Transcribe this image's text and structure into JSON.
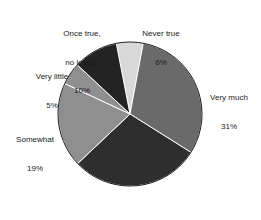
{
  "chart_data": {
    "type": "pie",
    "title": "",
    "subtitle": "",
    "xlabel": "",
    "ylabel": "",
    "legend_position": "none",
    "grid": false,
    "labels_show_percent": true,
    "start_angle_deg": -11,
    "direction": "clockwise",
    "categories": [
      "Never true",
      "Very much",
      "Quite a bit",
      "Somewhat",
      "Very little",
      "Once true, no longer"
    ],
    "values": [
      6,
      31,
      29,
      19,
      5,
      10
    ],
    "slices": [
      {
        "label": "Never true",
        "label_line1": "Never true",
        "percent_text": "6%",
        "value": 6,
        "color": "#d8d8d8"
      },
      {
        "label": "Very much",
        "label_line1": "Very much",
        "percent_text": "31%",
        "value": 31,
        "color": "#6a6a6a"
      },
      {
        "label": "Quite a bit",
        "label_line1": "Quite a bit",
        "percent_text": "",
        "value": 29,
        "color": "#2e2e2e"
      },
      {
        "label": "Somewhat",
        "label_line1": "Somewhat",
        "percent_text": "19%",
        "value": 19,
        "color": "#8f8f8f"
      },
      {
        "label": "Very little",
        "label_line1": "Very little",
        "percent_text": "5%",
        "value": 5,
        "color": "#8f8f8f"
      },
      {
        "label": "Once true, no longer",
        "label_line1": "Once true,",
        "label_line2": "no longer",
        "percent_text": "10%",
        "value": 10,
        "color": "#232323"
      }
    ],
    "geometry": {
      "center_x": 130,
      "center_y": 114,
      "radius": 72
    },
    "colors": {
      "background": "#ffffff",
      "text": "#1a1a1a",
      "outline": "#1a1a1a"
    }
  }
}
